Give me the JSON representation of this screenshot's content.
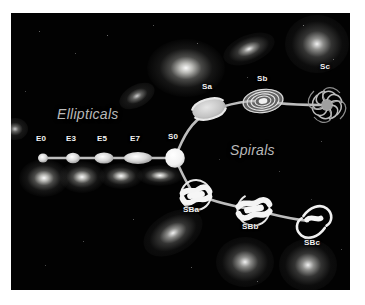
{
  "figure": {
    "name": "hubble-tuning-fork",
    "background_color": "#020202",
    "frame_color": "#ffffff",
    "label_color": "#f2f2f2",
    "group_label_color": "#b9b9b9",
    "schematic_color": "#c8c8c8"
  },
  "group_labels": [
    {
      "id": "ellipticals",
      "text": "Ellipticals",
      "x": 46,
      "y": 101
    },
    {
      "id": "spirals",
      "text": "Spirals",
      "x": 229,
      "y": 135
    }
  ],
  "sequences": {
    "ellipticals": {
      "name": "Ellipticals",
      "nodes": [
        {
          "label": "E0",
          "x": 32,
          "y": 145,
          "rx": 5.0,
          "ry": 4.6,
          "label_x": 25,
          "label_y": 129
        },
        {
          "label": "E3",
          "x": 62,
          "y": 145,
          "rx": 7.0,
          "ry": 5.2,
          "label_x": 55,
          "label_y": 129
        },
        {
          "label": "E5",
          "x": 93,
          "y": 145,
          "rx": 9.5,
          "ry": 5.6,
          "label_x": 86,
          "label_y": 129
        },
        {
          "label": "E7",
          "x": 127,
          "y": 145,
          "rx": 14.0,
          "ry": 6.0,
          "label_x": 119,
          "label_y": 129
        },
        {
          "label": "S0",
          "x": 164,
          "y": 145,
          "rx": 9.5,
          "ry": 9.5,
          "label_x": 157,
          "label_y": 127
        }
      ]
    },
    "spirals_normal": {
      "name": "Spirals",
      "nodes": [
        {
          "label": "Sa",
          "x": 198,
          "y": 96,
          "label_x": 190,
          "label_y": 76
        },
        {
          "label": "Sb",
          "x": 252,
          "y": 88,
          "label_x": 245,
          "label_y": 68
        },
        {
          "label": "Sc",
          "x": 316,
          "y": 92,
          "label_x": 309,
          "label_y": 56
        }
      ]
    },
    "spirals_barred": {
      "name": "Barred Spirals",
      "nodes": [
        {
          "label": "SBa",
          "x": 185,
          "y": 182,
          "label_x": 174,
          "label_y": 198
        },
        {
          "label": "SBb",
          "x": 243,
          "y": 196,
          "label_x": 232,
          "label_y": 214
        },
        {
          "label": "SBc",
          "x": 303,
          "y": 208,
          "label_x": 294,
          "label_y": 232
        }
      ]
    }
  },
  "photographic_galaxies": [
    {
      "id": "photo-elliptical-1",
      "x": 30,
      "y": 172,
      "w": 46,
      "h": 34,
      "kind": "elliptical"
    },
    {
      "id": "photo-elliptical-2",
      "x": 66,
      "y": 172,
      "w": 44,
      "h": 30,
      "kind": "elliptical"
    },
    {
      "id": "photo-elliptical-3",
      "x": 104,
      "y": 173,
      "w": 42,
      "h": 26,
      "kind": "elliptical"
    },
    {
      "id": "photo-elliptical-4",
      "x": 142,
      "y": 172,
      "w": 44,
      "h": 22,
      "kind": "elliptical"
    },
    {
      "id": "photo-sa-lenticular",
      "x": 125,
      "y": 92,
      "w": 34,
      "h": 20,
      "kind": "lenticular"
    },
    {
      "id": "photo-sa-bright",
      "x": 155,
      "y": 45,
      "w": 70,
      "h": 52,
      "kind": "elliptical"
    },
    {
      "id": "photo-sb-edge",
      "x": 228,
      "y": 40,
      "w": 48,
      "h": 26,
      "kind": "spiral"
    },
    {
      "id": "photo-sc-face",
      "x": 290,
      "y": 22,
      "w": 58,
      "h": 52,
      "kind": "spiral"
    },
    {
      "id": "photo-sba-edge",
      "x": 155,
      "y": 222,
      "w": 58,
      "h": 36,
      "kind": "spiral"
    },
    {
      "id": "photo-sbb-barred",
      "x": 228,
      "y": 245,
      "w": 54,
      "h": 44,
      "kind": "spiral"
    },
    {
      "id": "photo-sbc-irregular",
      "x": 292,
      "y": 246,
      "w": 52,
      "h": 48,
      "kind": "spiral"
    },
    {
      "id": "photo-corner-faint",
      "x": 2,
      "y": 118,
      "w": 26,
      "h": 22,
      "kind": "faint"
    }
  ]
}
